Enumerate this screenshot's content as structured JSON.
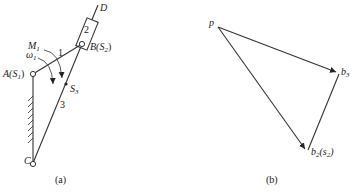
{
  "figure_a": {
    "caption": "(a)",
    "labels": {
      "D": "D",
      "link2": "2",
      "B": "B(S",
      "B_sub": "2",
      "B_close": ")",
      "M": "M",
      "M_sub": "1",
      "omega": "ω",
      "omega_sub": "1",
      "link1": "1",
      "A": "A(S",
      "A_sub": "1",
      "A_close": ")",
      "S3": "S",
      "S3_sub": "3",
      "link3": "3",
      "C": "C"
    }
  },
  "figure_b": {
    "caption": "(b)",
    "labels": {
      "p": "p",
      "b3": "b",
      "b3_sub": "3",
      "b2": "b",
      "b2_sub": "2",
      "b2_paren": "(s",
      "b2_paren_sub": "2",
      "b2_close": ")"
    }
  },
  "colors": {
    "stroke": "#333333",
    "background": "#ffffff"
  }
}
